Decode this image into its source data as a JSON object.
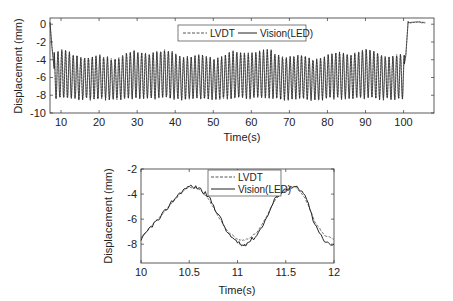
{
  "chart_data": [
    {
      "id": "full",
      "type": "line",
      "title": "",
      "xlabel": "Time(s)",
      "ylabel": "Displacement (mm)",
      "xlim": [
        7.1,
        108
      ],
      "ylim": [
        -10,
        0.7
      ],
      "xticks": [
        10,
        20,
        30,
        40,
        50,
        60,
        70,
        80,
        90,
        100
      ],
      "yticks": [
        0,
        -2,
        -4,
        -6,
        -8,
        -10
      ],
      "grid": false,
      "legend_position": "upper center",
      "signal_description": {
        "initial_drop": {
          "t": [
            7.1,
            7.6,
            8.2
          ],
          "y": [
            0.2,
            -2.5,
            -5.0
          ]
        },
        "oscillation": {
          "t_start": 8.2,
          "t_end": 100.2,
          "frequency_hz": 1.0,
          "peak": -3.5,
          "trough": -8.4,
          "mean": -5.9
        },
        "step_up": {
          "t": [
            100.2,
            100.6,
            101.2
          ],
          "y": [
            -4.5,
            -3.5,
            0.3
          ]
        },
        "hold": {
          "t": [
            101.2,
            106
          ],
          "y": [
            0.2,
            0.2
          ]
        }
      },
      "series": [
        {
          "name": "LVDT",
          "style": "dashed",
          "color": "#555555"
        },
        {
          "name": "Vision(LED)",
          "style": "solid",
          "color": "#222222"
        }
      ]
    },
    {
      "id": "zoom",
      "type": "line",
      "title": "",
      "xlabel": "Time(s)",
      "ylabel": "Displacement (mm)",
      "xlim": [
        10,
        12
      ],
      "ylim": [
        -9.5,
        -2
      ],
      "xticks": [
        10,
        10.5,
        11,
        11.5,
        12
      ],
      "yticks": [
        -2,
        -4,
        -6,
        -8
      ],
      "grid": false,
      "legend_position": "upper center",
      "x": [
        10.0,
        10.1,
        10.2,
        10.3,
        10.4,
        10.5,
        10.6,
        10.7,
        10.8,
        10.9,
        11.0,
        11.05,
        11.1,
        11.2,
        11.3,
        11.4,
        11.5,
        11.6,
        11.7,
        11.8,
        11.9,
        12.0
      ],
      "series": [
        {
          "name": "LVDT",
          "style": "dashed",
          "color": "#666666",
          "values": [
            -7.5,
            -6.6,
            -5.8,
            -4.9,
            -4.0,
            -3.4,
            -3.6,
            -4.4,
            -5.8,
            -7.0,
            -7.6,
            -7.7,
            -7.6,
            -7.1,
            -5.8,
            -4.3,
            -3.7,
            -3.4,
            -4.3,
            -6.2,
            -7.3,
            -7.6
          ]
        },
        {
          "name": "Vision(LED)",
          "style": "solid",
          "color": "#222222",
          "values": [
            -7.7,
            -6.6,
            -5.9,
            -4.8,
            -3.9,
            -3.4,
            -3.5,
            -4.2,
            -5.6,
            -7.1,
            -7.9,
            -8.1,
            -7.9,
            -7.3,
            -5.9,
            -4.2,
            -3.6,
            -3.4,
            -4.1,
            -6.4,
            -7.8,
            -8.0
          ]
        }
      ]
    }
  ],
  "charts": {
    "top": {
      "xlabel": "Time(s)",
      "ylabel": "Displacement (mm)",
      "xtick_labels": [
        "10",
        "20",
        "30",
        "40",
        "50",
        "60",
        "70",
        "80",
        "90",
        "100"
      ],
      "ytick_labels": [
        "0",
        "-2",
        "-4",
        "-6",
        "-8",
        "-10"
      ],
      "legend": {
        "lvdt": "LVDT",
        "vision": "Vision(LED)"
      }
    },
    "bottom": {
      "xlabel": "Time(s)",
      "ylabel": "Displacement (mm)",
      "xtick_labels": [
        "10",
        "10.5",
        "11",
        "11.5",
        "12"
      ],
      "ytick_labels": [
        "-2",
        "-4",
        "-6",
        "-8"
      ],
      "legend": {
        "lvdt": "LVDT",
        "vision": "Vision(LED)"
      }
    }
  }
}
